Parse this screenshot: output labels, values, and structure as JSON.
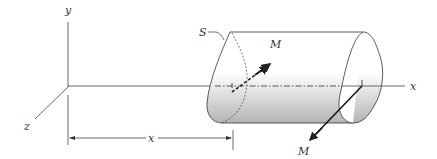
{
  "figure": {
    "labels": {
      "y_axis": "y",
      "z_axis": "z",
      "x_axis": "x",
      "section": "S",
      "moment_top": "M",
      "moment_bottom": "M",
      "distance": "x"
    },
    "colors": {
      "line": "#333333",
      "shade_dark": "#b8b8b8",
      "shade_light": "#ffffff"
    }
  }
}
